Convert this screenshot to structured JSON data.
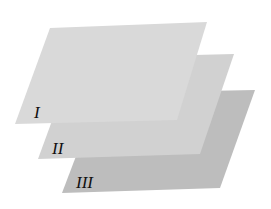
{
  "diagram": {
    "title": "",
    "planes": [
      {
        "label": "I",
        "color": "#d9d9d9",
        "points": "50,28 207,22 177,120 15,124",
        "label_pos": {
          "x": 34,
          "y": 118
        }
      },
      {
        "label": "II",
        "color": "#d1d1d1",
        "points": "75,58 234,54 200,154 38,159",
        "label_pos": {
          "x": 52,
          "y": 154
        }
      },
      {
        "label": "III",
        "color": "#bdbdbd",
        "points": "100,93 255,90 220,188 62,193",
        "label_pos": {
          "x": 76,
          "y": 188
        }
      }
    ]
  }
}
